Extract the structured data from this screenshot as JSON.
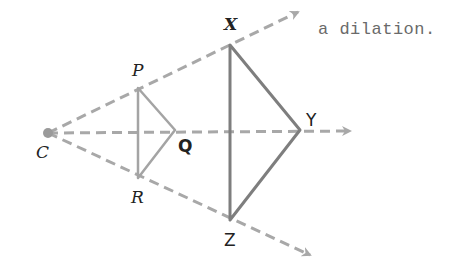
{
  "caption": "a dilation.",
  "colors": {
    "ray": "#a8a8a8",
    "small_triangle": "#a4a4a4",
    "large_triangle": "#7e7e7e",
    "center_point": "#9a9a9a",
    "label": "#222222",
    "caption": "#6a6a6a"
  },
  "center": {
    "label": "C",
    "x": 48,
    "y": 133
  },
  "rays": [
    {
      "name": "ray-through-P-X",
      "from": [
        48,
        133
      ],
      "to": [
        298,
        12
      ]
    },
    {
      "name": "ray-through-Q-Y",
      "from": [
        48,
        133
      ],
      "to": [
        350,
        131
      ]
    },
    {
      "name": "ray-through-R-Z",
      "from": [
        48,
        133
      ],
      "to": [
        310,
        255
      ]
    }
  ],
  "preimage": {
    "name": "triangle PQR",
    "vertices": [
      {
        "label": "P",
        "x": 138,
        "y": 88
      },
      {
        "label": "Q",
        "x": 175,
        "y": 130
      },
      {
        "label": "R",
        "x": 138,
        "y": 178
      }
    ]
  },
  "image": {
    "name": "triangle XYZ",
    "vertices": [
      {
        "label": "X",
        "x": 230,
        "y": 45
      },
      {
        "label": "Y",
        "x": 300,
        "y": 130
      },
      {
        "label": "Z",
        "x": 230,
        "y": 220
      }
    ]
  },
  "labels": {
    "C": "C",
    "P": "P",
    "Q": "Q",
    "R": "R",
    "X": "X",
    "Y": "Y",
    "Z": "Z"
  }
}
